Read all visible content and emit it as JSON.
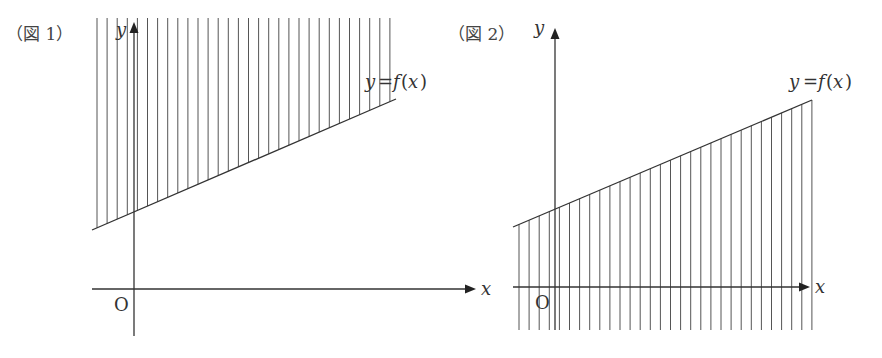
{
  "figures": [
    {
      "caption": "（図 1）",
      "y_axis_label": "y",
      "x_axis_label": "x",
      "origin_label": "O",
      "curve_label": "y = f(x)",
      "shaded_region": "above the line y = f(x)",
      "line_type": "linear, increasing"
    },
    {
      "caption": "（図 2）",
      "y_axis_label": "y",
      "x_axis_label": "x",
      "origin_label": "O",
      "curve_label": "y = f(x)",
      "shaded_region": "below the line y = f(x)",
      "line_type": "linear, increasing"
    }
  ]
}
